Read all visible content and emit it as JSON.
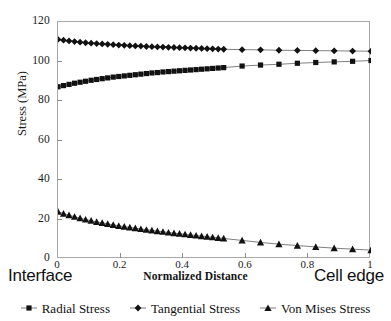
{
  "chart_data": {
    "type": "line",
    "title": "",
    "xlabel": "Normalized Distance",
    "ylabel": "Stress (MPa)",
    "xlim": [
      0,
      1
    ],
    "ylim": [
      0,
      120
    ],
    "grid": false,
    "legend_position": "bottom",
    "x_axis_end_labels": {
      "left": "Interface",
      "right": "Cell edge"
    },
    "xticks": [
      "0",
      "0.2",
      "0.4",
      "0.6",
      "0.8",
      "1"
    ],
    "xtick_values": [
      0,
      0.2,
      0.4,
      0.6,
      0.8,
      1
    ],
    "yticks": [
      "0",
      "20",
      "40",
      "60",
      "80",
      "100",
      "120"
    ],
    "ytick_values": [
      0,
      20,
      40,
      60,
      80,
      100,
      120
    ],
    "x": [
      0,
      0.0176,
      0.0353,
      0.0529,
      0.0706,
      0.0882,
      0.1059,
      0.1235,
      0.1412,
      0.1588,
      0.1765,
      0.1941,
      0.2118,
      0.2294,
      0.2471,
      0.2647,
      0.2824,
      0.3,
      0.3176,
      0.3353,
      0.3529,
      0.3706,
      0.3882,
      0.4059,
      0.4235,
      0.4412,
      0.4588,
      0.4765,
      0.4941,
      0.5118,
      0.5294,
      0.5882,
      0.6471,
      0.7059,
      0.7647,
      0.8235,
      0.8824,
      0.9412,
      1
    ],
    "series": [
      {
        "name": "Radial Stress",
        "marker": "square",
        "values": [
          87.2,
          87.8,
          88.4,
          89.0,
          89.5,
          90.0,
          90.5,
          90.9,
          91.3,
          91.7,
          92.1,
          92.4,
          92.7,
          93.0,
          93.3,
          93.6,
          93.9,
          94.2,
          94.4,
          94.7,
          94.9,
          95.1,
          95.3,
          95.5,
          95.7,
          95.9,
          96.1,
          96.3,
          96.5,
          96.7,
          96.9,
          97.7,
          98.2,
          98.6,
          99.1,
          99.5,
          99.8,
          100.1,
          100.5
        ]
      },
      {
        "name": "Tangential Stress",
        "marker": "diamond",
        "values": [
          111.2,
          110.8,
          110.4,
          110.1,
          109.8,
          109.5,
          109.3,
          109.1,
          108.9,
          108.7,
          108.5,
          108.3,
          108.2,
          108.0,
          107.9,
          107.8,
          107.6,
          107.5,
          107.4,
          107.3,
          107.2,
          107.1,
          107.0,
          106.9,
          106.8,
          106.7,
          106.6,
          106.5,
          106.4,
          106.3,
          106.2,
          106.0,
          105.9,
          105.7,
          105.6,
          105.5,
          105.4,
          105.3,
          105.2
        ]
      },
      {
        "name": "Von Mises Stress",
        "marker": "triangle",
        "values": [
          24.0,
          23.0,
          22.2,
          21.4,
          20.7,
          20.0,
          19.4,
          18.8,
          18.3,
          17.8,
          17.3,
          16.8,
          16.4,
          16.0,
          15.6,
          15.2,
          14.8,
          14.5,
          14.1,
          13.8,
          13.4,
          13.1,
          12.8,
          12.5,
          12.2,
          11.9,
          11.6,
          11.3,
          11.0,
          10.7,
          10.4,
          9.4,
          8.4,
          7.5,
          6.8,
          6.1,
          5.5,
          5.0,
          4.5
        ]
      }
    ]
  }
}
